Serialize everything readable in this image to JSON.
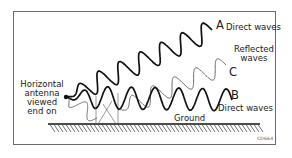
{
  "diagram": {
    "antenna_label": [
      "Horizontal",
      "antenna",
      "viewed",
      "end on"
    ],
    "wave_a": {
      "letter": "A",
      "label": "Direct waves"
    },
    "reflected": {
      "label_line1": "Reflected",
      "label_line2": "waves",
      "letter": "C"
    },
    "wave_b": {
      "letter": "B",
      "label": "Direct waves"
    },
    "ground_label": "Ground",
    "figure_code": "CD664"
  }
}
